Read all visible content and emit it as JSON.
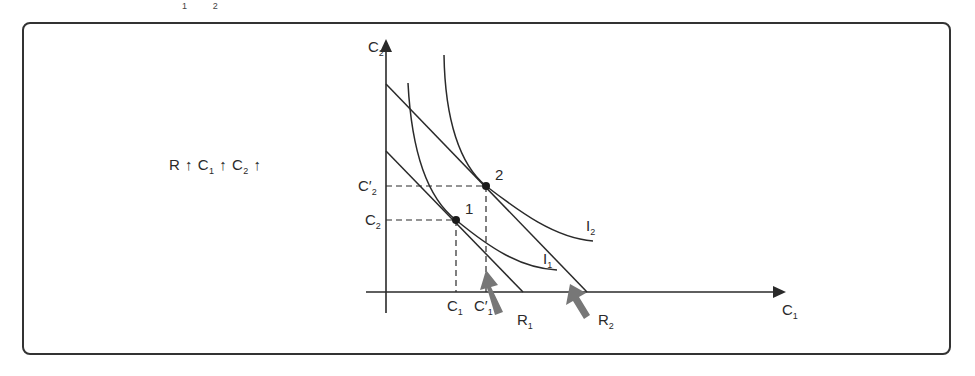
{
  "top_fragment": {
    "a_sub": "1",
    "b_sub": "2"
  },
  "caption": {
    "r": "R",
    "arrow": "↑",
    "c1": "C",
    "c1_sub": "1",
    "c2": "C",
    "c2_sub": "2"
  },
  "axes": {
    "y_label": "C",
    "y_sub": "2",
    "x_label": "C",
    "x_sub": "1"
  },
  "ticks": {
    "c2_prime": "C′",
    "c2_prime_sub": "2",
    "c2": "C",
    "c2_sub": "2",
    "c1": "C",
    "c1_sub": "1",
    "c1_prime": "C′",
    "c1_prime_sub": "1"
  },
  "points": {
    "p1": "1",
    "p2": "2"
  },
  "curves": {
    "i1": "I",
    "i1_sub": "1",
    "i2": "I",
    "i2_sub": "2"
  },
  "budget_lines": {
    "r1": "R",
    "r1_sub": "1",
    "r2": "R",
    "r2_sub": "2"
  },
  "colors": {
    "line": "#2a2a2a",
    "arrow": "#777777"
  }
}
